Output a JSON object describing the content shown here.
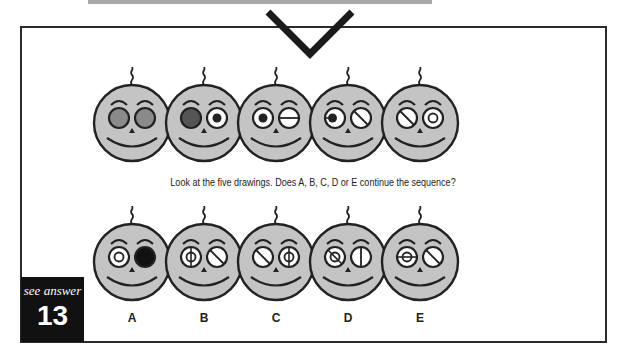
{
  "puzzle": {
    "instructions": "Look at the five drawings. Does A, B, C, D or E continue the sequence?",
    "answer_ref": {
      "label": "see answer",
      "number": "13"
    },
    "sequence": [
      {
        "left_eye": "gray-filled",
        "right_eye": "gray-filled"
      },
      {
        "left_eye": "dark-filled",
        "right_eye": "pupil-center"
      },
      {
        "left_eye": "pupil-center",
        "right_eye": "horizontal-line"
      },
      {
        "left_eye": "pupil-left",
        "right_eye": "diagonal-line"
      },
      {
        "left_eye": "diagonal-line",
        "right_eye": "ring"
      }
    ],
    "options": [
      {
        "label": "A",
        "left_eye": "ring",
        "right_eye": "black-filled"
      },
      {
        "label": "B",
        "left_eye": "ring-vertical-line",
        "right_eye": "diagonal-line"
      },
      {
        "label": "C",
        "left_eye": "diagonal-line",
        "right_eye": "ring-vertical-line"
      },
      {
        "label": "D",
        "left_eye": "ring-diagonal-line",
        "right_eye": "vertical-line"
      },
      {
        "label": "E",
        "left_eye": "ring-horizontal-line",
        "right_eye": "diagonal-line"
      }
    ]
  },
  "colors": {
    "face": "#c4c4c4",
    "outline": "#222222",
    "gray_eye": "#8a8a8a",
    "dark_eye": "#555555",
    "black": "#111111"
  }
}
